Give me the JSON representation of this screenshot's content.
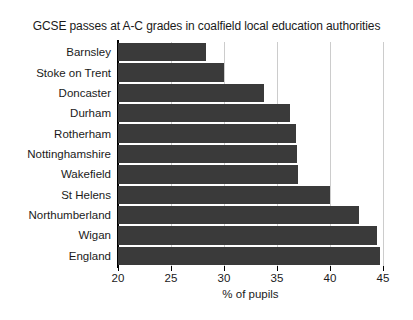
{
  "chart_data": {
    "type": "bar",
    "orientation": "horizontal",
    "title": "GCSE passes at A-C grades in coalfield local education authorities",
    "xlabel": "% of pupils",
    "ylabel": "",
    "xlim": [
      20,
      45
    ],
    "xticks": [
      20,
      25,
      30,
      35,
      40,
      45
    ],
    "xtick_labels": [
      "20",
      "25",
      "30",
      "35",
      "40",
      "45"
    ],
    "grid": "vertical",
    "legend": "none",
    "categories": [
      "Barnsley",
      "Stoke on Trent",
      "Doncaster",
      "Durham",
      "Rotherham",
      "Nottinghamshire",
      "Wakefield",
      "St Helens",
      "Northumberland",
      "Wigan",
      "England"
    ],
    "values": [
      28.3,
      30.0,
      33.8,
      36.2,
      36.8,
      36.9,
      37.0,
      40.0,
      42.7,
      44.4,
      44.7
    ],
    "bar_color": "#3a3a3a",
    "grid_color": "#cccccc",
    "axis_color": "#000000"
  }
}
